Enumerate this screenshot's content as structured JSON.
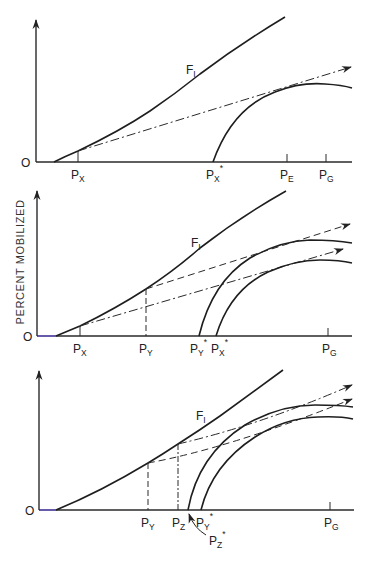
{
  "figure": {
    "y_axis_label": "PERCENT MOBILIZED",
    "origin_label": "O",
    "panels": [
      {
        "id": "top",
        "curve_label": {
          "main": "F",
          "sub": "I"
        },
        "x_labels": [
          {
            "main": "P",
            "sub": "X",
            "sup": ""
          },
          {
            "main": "P",
            "sub": "X",
            "sup": "*"
          },
          {
            "main": "P",
            "sub": "E",
            "sup": ""
          },
          {
            "main": "P",
            "sub": "G",
            "sup": ""
          }
        ]
      },
      {
        "id": "middle",
        "curve_label": {
          "main": "F",
          "sub": "I"
        },
        "x_labels": [
          {
            "main": "P",
            "sub": "X",
            "sup": ""
          },
          {
            "main": "P",
            "sub": "Y",
            "sup": ""
          },
          {
            "main": "P",
            "sub": "Y",
            "sup": "*"
          },
          {
            "main": "P",
            "sub": "X",
            "sup": "*"
          },
          {
            "main": "P",
            "sub": "G",
            "sup": ""
          }
        ]
      },
      {
        "id": "bottom",
        "curve_label": {
          "main": "F",
          "sub": "I"
        },
        "x_labels": [
          {
            "main": "P",
            "sub": "Y",
            "sup": ""
          },
          {
            "main": "P",
            "sub": "Z",
            "sup": ""
          },
          {
            "main": "P",
            "sub": "Y",
            "sup": "*"
          },
          {
            "main": "P",
            "sub": "G",
            "sup": ""
          }
        ],
        "callout_label": {
          "main": "P",
          "sub": "Z",
          "sup": "*"
        }
      }
    ]
  }
}
